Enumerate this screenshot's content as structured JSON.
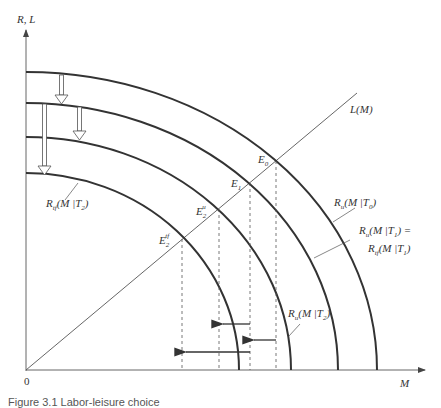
{
  "diagram": {
    "y_axis_label": "R, L",
    "x_axis_label": "M",
    "origin_label": "0",
    "line_label": "L(M)",
    "curves": [
      {
        "id": "Ru_T0",
        "label": "R_u(M|T0)",
        "main": "R",
        "sub": "u",
        "arg": "(M |T",
        "argsub": "0",
        "close": ")"
      },
      {
        "id": "Ru_T1_eq_Rtf_T1",
        "label": "R_u(M|T1) = R_tf(M|T1)",
        "line1_main": "R",
        "line1_sub": "u",
        "line1_arg": "(M |T",
        "line1_argsub": "1",
        "line1_close": ") =",
        "line2_main": "R",
        "line2_sub": "tf",
        "line2_arg": "(M |T",
        "line2_argsub": "1",
        "line2_close": ")"
      },
      {
        "id": "Ru_T2",
        "label": "R_u(M|T2)",
        "main": "R",
        "sub": "u",
        "arg": "(M |T",
        "argsub": "2",
        "close": ")"
      },
      {
        "id": "Rtf_T2",
        "label": "R_tf(M|T2)",
        "main": "R",
        "sub": "tf",
        "arg": "(M |T",
        "argsub": "2",
        "close": ")"
      }
    ],
    "equilibria": [
      {
        "main": "E",
        "sub": "0",
        "sup": ""
      },
      {
        "main": "E",
        "sub": "1",
        "sup": ""
      },
      {
        "main": "E",
        "sub": "2",
        "sup": "u"
      },
      {
        "main": "E",
        "sub": "2",
        "sup": "tf"
      }
    ],
    "caption": "Figure 3.1   Labor-leisure choice"
  }
}
